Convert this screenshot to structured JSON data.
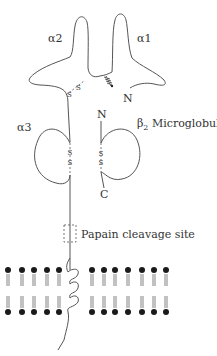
{
  "diagram": {
    "labels": {
      "alpha2": "α2",
      "alpha1": "α1",
      "alpha3": "α3",
      "n_terminus_heavy": "N",
      "n_terminus_b2m": "N",
      "c_terminus_b2m": "C",
      "b2m_prefix": "β",
      "b2m_sub": "2",
      "b2m_suffix": " Microglobulin",
      "papain": "Papain cleavage site",
      "disulfide_s": "S"
    },
    "colors": {
      "line": "#555555",
      "lipid_head": "#1a1a1a",
      "background": "#ffffff"
    },
    "membrane": {
      "top_row_y": 270,
      "bottom_row_y": 312,
      "left_heads_x": [
        8,
        22,
        34,
        47,
        59
      ],
      "right_heads_x": [
        92,
        104,
        115,
        128,
        142,
        154,
        166
      ]
    }
  }
}
